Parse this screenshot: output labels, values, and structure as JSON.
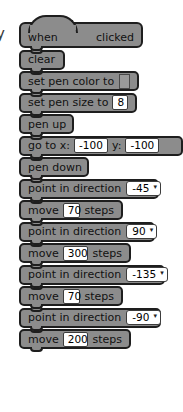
{
  "canvas": {
    "background": "#ffffff",
    "edge_glyph": "y"
  },
  "palette": {
    "block_fill": "#8c8c8c",
    "block_outline": "#1e1e1e",
    "input_fill": "#ffffff",
    "text_color": "#111111",
    "pen_color_swatch": "#9a9a9a"
  },
  "script": {
    "name": "scratch-script-stack",
    "blocks": [
      {
        "id": "when-flag-clicked",
        "type": "hat",
        "label_before": "when",
        "icon": "green-flag-icon",
        "label_after": "clicked",
        "width": 124
      },
      {
        "id": "clear",
        "type": "stack",
        "label": "clear",
        "width": 46
      },
      {
        "id": "set-pen-color-to",
        "type": "stack",
        "label": "set pen color to",
        "color_value": "#9a9a9a",
        "width": 120
      },
      {
        "id": "set-pen-size-to",
        "type": "stack",
        "label": "set pen size to",
        "value": "8",
        "width": 118
      },
      {
        "id": "pen-up",
        "type": "stack",
        "label": "pen up",
        "width": 55
      },
      {
        "id": "go-to-xy",
        "type": "stack",
        "label_x": "go to x:",
        "value_x": "-100",
        "label_y": "y:",
        "value_y": "-100",
        "width": 164
      },
      {
        "id": "pen-down",
        "type": "stack",
        "label": "pen down",
        "width": 70
      },
      {
        "id": "point-in-direction-1",
        "type": "stack",
        "label": "point in direction",
        "value": "-45",
        "width": 140
      },
      {
        "id": "move-steps-1",
        "type": "stack",
        "label_before": "move",
        "value": "70",
        "label_after": "steps",
        "width": 104
      },
      {
        "id": "point-in-direction-2",
        "type": "stack",
        "label": "point in direction",
        "value": "90",
        "width": 136
      },
      {
        "id": "move-steps-2",
        "type": "stack",
        "label_before": "move",
        "value": "300",
        "label_after": "steps",
        "width": 112
      },
      {
        "id": "point-in-direction-3",
        "type": "stack",
        "label": "point in direction",
        "value": "-135",
        "width": 146
      },
      {
        "id": "move-steps-3",
        "type": "stack",
        "label_before": "move",
        "value": "70",
        "label_after": "steps",
        "width": 104
      },
      {
        "id": "point-in-direction-4",
        "type": "stack",
        "label": "point in direction",
        "value": "-90",
        "width": 142
      },
      {
        "id": "move-steps-4",
        "type": "stack",
        "label_before": "move",
        "value": "200",
        "label_after": "steps",
        "width": 112
      }
    ]
  },
  "dropdown_arrow": "▾"
}
